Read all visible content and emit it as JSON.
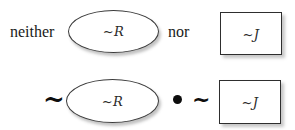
{
  "diagram": {
    "background_color": "#ffffff",
    "ink_color": "#1a1a1a",
    "rows": [
      {
        "name": "english-row",
        "items": [
          {
            "kind": "word",
            "text": "neither"
          },
          {
            "kind": "ellipse",
            "label": "~R"
          },
          {
            "kind": "word",
            "text": "nor"
          },
          {
            "kind": "rect",
            "label": "~J"
          }
        ]
      },
      {
        "name": "symbolic-row",
        "items": [
          {
            "kind": "operator",
            "text": "~",
            "semantic": "negation"
          },
          {
            "kind": "ellipse",
            "label": "~R"
          },
          {
            "kind": "operator",
            "text": "•",
            "semantic": "conjunction-dot"
          },
          {
            "kind": "operator",
            "text": "~",
            "semantic": "negation"
          },
          {
            "kind": "rect",
            "label": "~J"
          }
        ]
      }
    ]
  },
  "labels": {
    "neither": "neither",
    "nor": "nor",
    "not_r": "~R",
    "not_j": "~J",
    "tilde": "~",
    "dot": "•"
  }
}
